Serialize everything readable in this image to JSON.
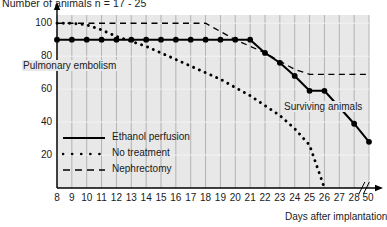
{
  "chart_data": {
    "type": "line",
    "title": "Number of animals n = 17 - 25",
    "xlabel": "Days after implantation",
    "ylabel": "Number of animals",
    "xlim": [
      8,
      29
    ],
    "ylim": [
      0,
      105
    ],
    "grid": true,
    "axis_break": {
      "after": 28,
      "final_tick": 50
    },
    "x_ticks": [
      "8",
      "9",
      "10",
      "11",
      "12",
      "13",
      "14",
      "15",
      "16",
      "17",
      "18",
      "19",
      "20",
      "21",
      "22",
      "23",
      "24",
      "25",
      "26",
      "27",
      "28",
      "50"
    ],
    "y_ticks": [
      "20",
      "40",
      "60",
      "80",
      "100"
    ],
    "legend_position": "inside-lower-left",
    "annotations": [
      {
        "text": "Pulmonary embolism",
        "x": 8.2,
        "y": 82
      },
      {
        "text": "Surviving animals",
        "x": 24.4,
        "y": 62
      }
    ],
    "series": [
      {
        "name": "Ethanol perfusion",
        "style": "solid",
        "marker": "filled-circle",
        "x": [
          8,
          9,
          10,
          11,
          12,
          13,
          14,
          15,
          16,
          17,
          18,
          19,
          20,
          21,
          22,
          23,
          24,
          25,
          26,
          27,
          28,
          29
        ],
        "values": [
          90,
          90,
          90,
          90,
          90,
          90,
          90,
          90,
          90,
          90,
          90,
          90,
          90,
          90,
          82,
          76,
          68,
          59,
          59,
          49,
          39,
          28
        ]
      },
      {
        "name": "No treatment",
        "style": "dotted",
        "marker": "small-dot",
        "x": [
          8,
          9,
          10,
          11,
          12,
          13,
          14,
          15,
          16,
          17,
          18,
          19,
          20,
          21,
          22,
          23,
          24,
          25,
          26
        ],
        "values": [
          100,
          100,
          99,
          96,
          92,
          89,
          86,
          82,
          78,
          74,
          70,
          66,
          61,
          56,
          50,
          44,
          36,
          26,
          0
        ]
      },
      {
        "name": "Nephrectomy",
        "style": "dashed",
        "marker": "none",
        "x": [
          8,
          9,
          10,
          11,
          12,
          13,
          14,
          15,
          16,
          17,
          18,
          19,
          20,
          21,
          22,
          23,
          24,
          25,
          26,
          27,
          28,
          29
        ],
        "values": [
          100,
          100,
          100,
          100,
          100,
          100,
          100,
          100,
          100,
          100,
          100,
          95,
          90,
          86,
          82,
          77,
          72,
          69,
          69,
          69,
          69,
          69
        ]
      }
    ]
  },
  "legend": {
    "items": [
      {
        "label": "Ethanol perfusion",
        "style": "solid"
      },
      {
        "label": "No treatment",
        "style": "dotted"
      },
      {
        "label": "Nephrectomy",
        "style": "dashed"
      }
    ]
  }
}
